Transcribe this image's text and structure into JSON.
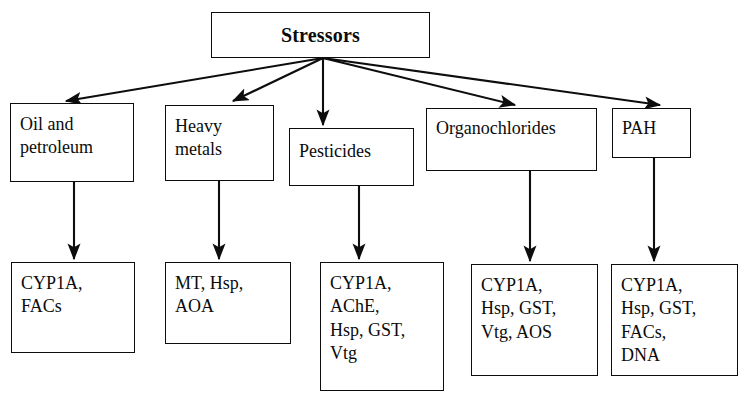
{
  "diagram": {
    "title": "Stressors",
    "type": "flowchart",
    "root": {
      "label": "Stressors"
    },
    "stressor_categories": [
      {
        "id": "oil",
        "label": "Oil and\npetroleum"
      },
      {
        "id": "heavy",
        "label": "Heavy\nmetals"
      },
      {
        "id": "pest",
        "label": "Pesticides"
      },
      {
        "id": "orga",
        "label": "Organochlorides"
      },
      {
        "id": "pah",
        "label": "PAH"
      }
    ],
    "biomarkers": [
      {
        "id": "b1",
        "for": "oil",
        "label": "CYP1A,\nFACs"
      },
      {
        "id": "b2",
        "for": "heavy",
        "label": "MT, Hsp,\nAOA"
      },
      {
        "id": "b3",
        "for": "pest",
        "label": "CYP1A,\nAChE,\nHsp, GST,\nVtg"
      },
      {
        "id": "b4",
        "for": "orga",
        "label": "CYP1A,\nHsp, GST,\nVtg, AOS"
      },
      {
        "id": "b5",
        "for": "pah",
        "label": "CYP1A,\nHsp, GST,\nFACs,\nDNA"
      }
    ],
    "colors": {
      "stroke": "#0d0d0d",
      "background": "#ffffff",
      "text": "#0b0b0b"
    }
  }
}
